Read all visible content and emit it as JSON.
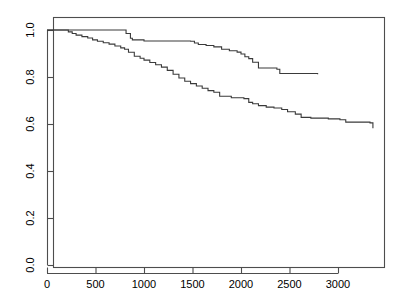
{
  "chart_data": {
    "type": "line",
    "title": "",
    "subtitle": "",
    "xlabel": "",
    "ylabel": "",
    "xlim": [
      -85,
      3480
    ],
    "ylim": [
      -0.04,
      1.04
    ],
    "grid": false,
    "legend": "none",
    "style": "kaplan-meier step curves (R base graphics)",
    "x_ticks": [
      0,
      500,
      1000,
      1500,
      2000,
      2500,
      3000
    ],
    "x_tick_labels": [
      "0",
      "500",
      "1000",
      "1500",
      "2000",
      "2500",
      "3000"
    ],
    "y_ticks": [
      0.0,
      0.2,
      0.4,
      0.6,
      0.8,
      1.0
    ],
    "y_tick_labels": [
      "0.0",
      "0.2",
      "0.4",
      "0.6",
      "0.8",
      "1.0"
    ],
    "series": [
      {
        "name": "upper-curve",
        "color": "#3a3a3a",
        "step": "post",
        "x": [
          0,
          800,
          815,
          860,
          880,
          1000,
          1480,
          1520,
          1560,
          1640,
          1720,
          1800,
          1880,
          1960,
          2000,
          2040,
          2080,
          2120,
          2180,
          2370,
          2400,
          2790
        ],
        "y": [
          1.0,
          1.0,
          0.985,
          0.965,
          0.958,
          0.953,
          0.952,
          0.945,
          0.938,
          0.934,
          0.928,
          0.918,
          0.912,
          0.906,
          0.898,
          0.886,
          0.878,
          0.863,
          0.838,
          0.833,
          0.815,
          0.812
        ]
      },
      {
        "name": "lower-curve",
        "color": "#3a3a3a",
        "step": "post",
        "x": [
          0,
          180,
          220,
          260,
          300,
          360,
          420,
          470,
          520,
          580,
          640,
          700,
          760,
          800,
          840,
          900,
          960,
          1000,
          1060,
          1120,
          1180,
          1240,
          1300,
          1360,
          1420,
          1480,
          1540,
          1600,
          1660,
          1720,
          1780,
          1900,
          2030,
          2080,
          2120,
          2180,
          2260,
          2340,
          2420,
          2480,
          2560,
          2620,
          2720,
          2900,
          3020,
          3080,
          3330,
          3360
        ],
        "y": [
          1.0,
          1.0,
          0.992,
          0.985,
          0.978,
          0.972,
          0.966,
          0.958,
          0.952,
          0.946,
          0.94,
          0.932,
          0.924,
          0.918,
          0.905,
          0.888,
          0.88,
          0.872,
          0.862,
          0.852,
          0.842,
          0.828,
          0.812,
          0.796,
          0.782,
          0.772,
          0.762,
          0.752,
          0.742,
          0.735,
          0.718,
          0.712,
          0.708,
          0.692,
          0.686,
          0.678,
          0.672,
          0.668,
          0.662,
          0.652,
          0.642,
          0.628,
          0.625,
          0.622,
          0.618,
          0.608,
          0.605,
          0.582
        ]
      }
    ],
    "notes": {
      "upper_curve_start_value": 1.0,
      "upper_curve_end_value": 0.81,
      "upper_curve_end_time": 2790,
      "lower_curve_start_value": 1.0,
      "lower_curve_end_value": 0.58,
      "lower_curve_end_time": 3360,
      "first_event_upper": 800,
      "first_event_lower": 180
    }
  },
  "axes": {
    "x_axis_name": "x-axis",
    "y_axis_name": "y-axis"
  }
}
